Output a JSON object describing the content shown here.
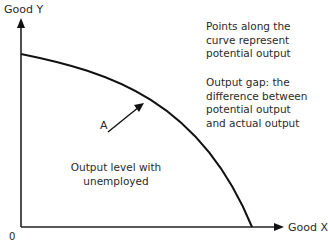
{
  "diagram": {
    "type": "production-possibility-frontier",
    "axes": {
      "y_label": "Good Y",
      "x_label": "Good X",
      "origin_label": "0"
    },
    "point_label": "A",
    "inner_label_line1": "Output level with",
    "inner_label_line2": "unemployed",
    "notes": {
      "note1_line1": "Points along the",
      "note1_line2": "curve represent",
      "note1_line3": "potential output",
      "note2_line1": "Output gap: the",
      "note2_line2": "difference between",
      "note2_line3": "potential output",
      "note2_line4": "and actual output"
    },
    "colors": {
      "line": "#111111",
      "text": "#2a2a2a",
      "background": "#ffffff"
    }
  }
}
